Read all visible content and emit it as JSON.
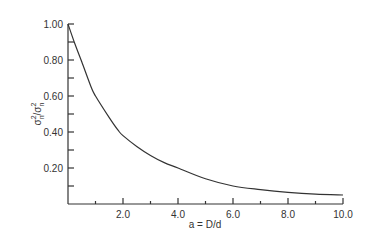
{
  "chart_data": {
    "type": "line",
    "title": "",
    "xlabel": "a = D/d",
    "ylabel": "σ̂²ₙ/σ²ₙ",
    "xlim": [
      0,
      10
    ],
    "ylim": [
      0,
      1.0
    ],
    "grid": false,
    "legend": null,
    "x_ticks": [
      "2.0",
      "4.0",
      "6.0",
      "8.0",
      "10.0"
    ],
    "y_ticks": [
      "0.20",
      "0.40",
      "0.60",
      "0.80",
      "1.00"
    ],
    "series": [
      {
        "name": "variance ratio",
        "x": [
          0,
          0.25,
          0.5,
          0.84,
          1.0,
          1.5,
          1.82,
          2.0,
          2.5,
          3.0,
          3.5,
          4.0,
          5.0,
          6.0,
          7.0,
          8.0,
          9.0,
          10.0
        ],
        "y": [
          1.0,
          0.89,
          0.79,
          0.65,
          0.6,
          0.48,
          0.41,
          0.38,
          0.32,
          0.27,
          0.23,
          0.2,
          0.14,
          0.1,
          0.08,
          0.065,
          0.055,
          0.05
        ]
      }
    ]
  },
  "axes": {
    "x_label_prefix": "a = D/d",
    "y_label_main": "σ",
    "y_label_sup": "2",
    "y_label_sub": "n"
  }
}
